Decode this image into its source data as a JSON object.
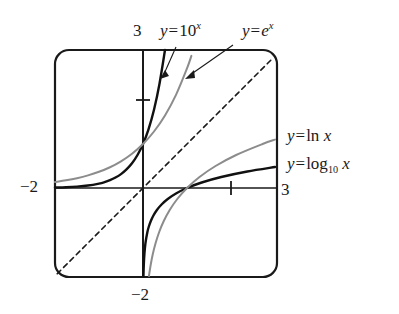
{
  "figure": {
    "background_color": "#ffffff",
    "frame": {
      "x": 55,
      "y": 50,
      "width": 222,
      "height": 227,
      "corner_radius": 14,
      "stroke_color": "#1a1a1a",
      "stroke_width": 2.2
    },
    "axes": {
      "origin_px": {
        "x": 143,
        "y": 188
      },
      "unit_px": 44,
      "x_axis_color": "#1a1a1a",
      "y_axis_color": "#1a1a1a",
      "x_tick_values": [
        2
      ],
      "y_tick_values": [
        2
      ]
    },
    "labels": {
      "y_axis_top": "3",
      "x_axis_right": "3",
      "x_axis_left": "−2",
      "y_axis_bottom": "−2"
    },
    "annotations": [
      {
        "name": "arrow-to-exp10",
        "from": [
          176,
          47
        ],
        "to": [
          165,
          75
        ]
      },
      {
        "name": "arrow-to-expe",
        "from": [
          232,
          46
        ],
        "to": [
          189,
          76
        ]
      }
    ]
  },
  "chart_data": {
    "type": "line",
    "xlabel": "x",
    "ylabel": "y",
    "xlim": [
      -2,
      3
    ],
    "ylim": [
      -2,
      3
    ],
    "grid": false,
    "legend": "inline-labels",
    "curve_labels": {
      "exp10": {
        "text": "y = 10^x",
        "parts": [
          "y",
          "=",
          "10",
          "x"
        ],
        "position": "top-center",
        "color": "#111111"
      },
      "expe": {
        "text": "y = e^x",
        "parts": [
          "y",
          "=",
          "e",
          "x"
        ],
        "position": "top-right",
        "color": "#8c8c8c"
      },
      "ln": {
        "text": "y = ln x",
        "parts": [
          "y",
          "=",
          "ln",
          "x"
        ],
        "position": "right-upper",
        "color": "#8c8c8c"
      },
      "log10": {
        "text": "y = log_10 x",
        "parts": [
          "y",
          "=",
          "log",
          "10",
          "x"
        ],
        "position": "right-lower",
        "color": "#111111"
      }
    },
    "series": [
      {
        "name": "y = 10^x",
        "style": "solid",
        "color": "#111111",
        "width": 2.4,
        "points": [
          [
            -2,
            0.01
          ],
          [
            -1.75,
            0.018
          ],
          [
            -1.5,
            0.032
          ],
          [
            -1.25,
            0.056
          ],
          [
            -1,
            0.1
          ],
          [
            -0.875,
            0.133
          ],
          [
            -0.75,
            0.178
          ],
          [
            -0.625,
            0.237
          ],
          [
            -0.5,
            0.316
          ],
          [
            -0.375,
            0.422
          ],
          [
            -0.25,
            0.562
          ],
          [
            -0.125,
            0.75
          ],
          [
            0,
            1
          ],
          [
            0.125,
            1.334
          ],
          [
            0.25,
            1.778
          ],
          [
            0.375,
            2.371
          ],
          [
            0.5,
            3.162
          ]
        ]
      },
      {
        "name": "y = e^x",
        "style": "solid",
        "color": "#8c8c8c",
        "width": 2.0,
        "points": [
          [
            -2,
            0.135
          ],
          [
            -1.75,
            0.174
          ],
          [
            -1.5,
            0.223
          ],
          [
            -1.25,
            0.287
          ],
          [
            -1,
            0.368
          ],
          [
            -0.75,
            0.472
          ],
          [
            -0.5,
            0.607
          ],
          [
            -0.25,
            0.779
          ],
          [
            0,
            1
          ],
          [
            0.25,
            1.284
          ],
          [
            0.5,
            1.649
          ],
          [
            0.75,
            2.117
          ],
          [
            1,
            2.718
          ],
          [
            1.1,
            3.004
          ]
        ]
      },
      {
        "name": "y = log_10 x",
        "style": "solid",
        "color": "#111111",
        "width": 2.4,
        "points": [
          [
            0.01,
            -2
          ],
          [
            0.018,
            -1.75
          ],
          [
            0.032,
            -1.5
          ],
          [
            0.056,
            -1.25
          ],
          [
            0.1,
            -1
          ],
          [
            0.133,
            -0.875
          ],
          [
            0.178,
            -0.75
          ],
          [
            0.237,
            -0.625
          ],
          [
            0.316,
            -0.5
          ],
          [
            0.422,
            -0.375
          ],
          [
            0.562,
            -0.25
          ],
          [
            0.75,
            -0.125
          ],
          [
            1,
            0
          ],
          [
            1.334,
            0.125
          ],
          [
            1.778,
            0.25
          ],
          [
            2.371,
            0.375
          ],
          [
            3,
            0.477
          ]
        ]
      },
      {
        "name": "y = ln x",
        "style": "solid",
        "color": "#8c8c8c",
        "width": 2.0,
        "points": [
          [
            0.135,
            -2
          ],
          [
            0.174,
            -1.75
          ],
          [
            0.223,
            -1.5
          ],
          [
            0.287,
            -1.25
          ],
          [
            0.368,
            -1
          ],
          [
            0.472,
            -0.75
          ],
          [
            0.607,
            -0.5
          ],
          [
            0.779,
            -0.25
          ],
          [
            1,
            0
          ],
          [
            1.284,
            0.25
          ],
          [
            1.649,
            0.5
          ],
          [
            2.117,
            0.75
          ],
          [
            2.718,
            1
          ],
          [
            3,
            1.099
          ]
        ]
      },
      {
        "name": "y = x",
        "style": "dashed",
        "color": "#1a1a1a",
        "width": 1.6,
        "points": [
          [
            -1.95,
            -1.95
          ],
          [
            2.95,
            2.95
          ]
        ]
      }
    ]
  }
}
